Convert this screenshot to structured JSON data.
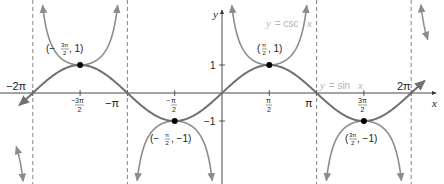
{
  "chart_data": {
    "type": "line",
    "title": "",
    "xlabel": "x",
    "ylabel": "y",
    "xlim": [
      -6.6,
      6.9
    ],
    "ylim": [
      -3.2,
      3.3
    ],
    "grid": false,
    "series": [
      {
        "name": "y = sin x",
        "function": "sin",
        "color": "#707070",
        "x": [
          -6.2832,
          -4.7124,
          -3.1416,
          -1.5708,
          0,
          1.5708,
          3.1416,
          4.7124,
          6.2832
        ],
        "values": [
          0,
          1,
          0,
          -1,
          0,
          1,
          0,
          -1,
          0
        ]
      },
      {
        "name": "y = csc x",
        "function": "csc",
        "color": "#8c8c8c",
        "x": [
          -4.7124,
          -1.5708,
          1.5708,
          4.7124
        ],
        "values": [
          1,
          -1,
          1,
          -1
        ]
      }
    ],
    "asymptotes": [
      "-2π",
      "-π",
      "π",
      "2π"
    ],
    "x_ticks": [
      {
        "value": -6.2832,
        "label": "−2π"
      },
      {
        "value": -4.7124,
        "label": "−3π/2"
      },
      {
        "value": -3.1416,
        "label": "−π"
      },
      {
        "value": -1.5708,
        "label": "−π/2"
      },
      {
        "value": 1.5708,
        "label": "π/2"
      },
      {
        "value": 3.1416,
        "label": "π"
      },
      {
        "value": 4.7124,
        "label": "3π/2"
      },
      {
        "value": 6.2832,
        "label": "2π"
      }
    ],
    "y_ticks": [
      {
        "value": 1,
        "label": "1"
      },
      {
        "value": -1,
        "label": "−1"
      }
    ],
    "annotations": [
      {
        "x": -4.7124,
        "y": 1,
        "label": "(−3π/2, 1)"
      },
      {
        "x": -1.5708,
        "y": -1,
        "label": "(−π/2, −1)"
      },
      {
        "x": 1.5708,
        "y": 1,
        "label": "(π/2, 1)"
      },
      {
        "x": 4.7124,
        "y": -1,
        "label": "(3π/2, −1)"
      }
    ],
    "legend": [
      {
        "label": "y = csc x",
        "position": "upper right of y-axis"
      },
      {
        "label": "y = sin x",
        "position": "right of π asymptote"
      }
    ]
  },
  "labels": {
    "axis_x": "x",
    "axis_y": "y",
    "y_one": "1",
    "y_neg_one": "−1",
    "neg_two_pi": "−2π",
    "neg_pi": "−π",
    "pi": "π",
    "two_pi": "2π",
    "pi_sym": "π",
    "two": "2",
    "three_pi": "3π",
    "legend_csc_prefix": "y",
    "legend_csc_eq": " = csc ",
    "legend_csc_var": "x",
    "legend_sin_prefix": "y",
    "legend_sin_eq": " = sin ",
    "legend_sin_var": "x",
    "ann1_open": "(−",
    "ann1_close": ", 1)",
    "ann2_open": "(−",
    "ann2_close": ", −1)",
    "ann3_open": "(",
    "ann3_close": ", 1)",
    "ann4_open": "(",
    "ann4_close": ", −1)"
  }
}
